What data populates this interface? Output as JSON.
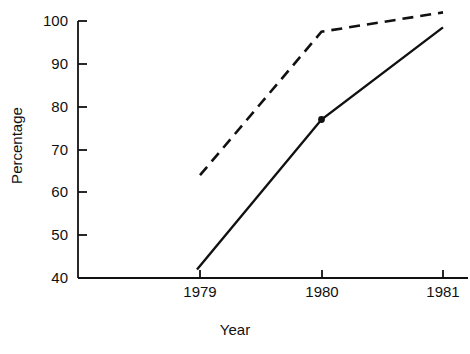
{
  "chart_data": {
    "type": "line",
    "title": "",
    "subtitle": "",
    "xlabel": "Year",
    "ylabel": "Percentage",
    "x": [
      1979,
      1980,
      1981
    ],
    "xtick_labels": [
      "1979",
      "1980",
      "1981"
    ],
    "ytick_labels": [
      "40",
      "50",
      "60",
      "70",
      "80",
      "90",
      "100"
    ],
    "yticks": [
      40,
      50,
      60,
      70,
      80,
      90,
      100
    ],
    "xlim": [
      1978.8,
      1981.2
    ],
    "ylim": [
      40,
      100
    ],
    "grid": false,
    "legend": "none",
    "annotations": [],
    "series": [
      {
        "name": "dashed-series",
        "style": "dashed",
        "color": "#111111",
        "marker": "none",
        "values": [
          64,
          97.5,
          102
        ]
      },
      {
        "name": "solid-series",
        "style": "solid",
        "color": "#111111",
        "marker": "dot-at-1980",
        "values": [
          42,
          77,
          98.5
        ]
      }
    ]
  },
  "axis": {
    "y_title": "Percentage",
    "x_title": "Year",
    "y_ticks": [
      {
        "label": "100",
        "value": 100
      },
      {
        "label": "90",
        "value": 90
      },
      {
        "label": "80",
        "value": 80
      },
      {
        "label": "70",
        "value": 70
      },
      {
        "label": "60",
        "value": 60
      },
      {
        "label": "50",
        "value": 50
      },
      {
        "label": "40",
        "value": 40
      }
    ],
    "x_ticks": [
      {
        "label": "1979",
        "value": 1979
      },
      {
        "label": "1980",
        "value": 1980
      },
      {
        "label": "1981",
        "value": 1981
      }
    ]
  },
  "colors": {
    "background": "#ffffff",
    "ink": "#111111",
    "axis": "#111111"
  }
}
